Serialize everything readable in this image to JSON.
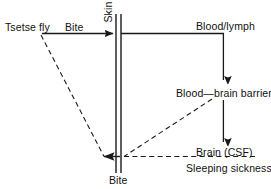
{
  "figure": {
    "type": "flow-diagram",
    "title": "",
    "background_color": "#ffffff",
    "line_color": "#1a1a1a",
    "text_color": "#111111"
  },
  "labels": {
    "tsetse_fly": "Tsetse fly",
    "bite_top": "Bite",
    "skin": "Skin",
    "blood_lymph": "Blood/lymph",
    "blood_brain_barrier": "Blood—brain barrier",
    "brain_csf": "Brain (CSF)",
    "sleeping_sickness": "Sleeping sickness",
    "bite_bottom": "Bite"
  },
  "icons": {
    "arrow_right": "arrow-right-icon",
    "arrow_down": "arrow-down-icon",
    "arrow_left": "arrow-left-icon",
    "skin_barrier": "skin-barrier-icon"
  },
  "edges": [
    {
      "name": "fly-bite-to-skin",
      "style": "solid",
      "direction": "right",
      "from": "Tsetse fly",
      "to": "Skin"
    },
    {
      "name": "skin-to-blood-lymph",
      "style": "solid",
      "direction": "right",
      "from": "Skin",
      "to": "Blood/lymph"
    },
    {
      "name": "blood-lymph-to-bbb",
      "style": "solid",
      "direction": "down",
      "from": "Blood/lymph",
      "to": "Blood—brain barrier"
    },
    {
      "name": "bbb-to-brain",
      "style": "solid",
      "direction": "down",
      "from": "Blood—brain barrier",
      "to": "Brain (CSF)"
    },
    {
      "name": "fly-to-bite-return",
      "style": "dashed",
      "direction": "left",
      "from": "Tsetse fly",
      "to": "Bite"
    },
    {
      "name": "bbb-to-bite-return",
      "style": "dashed",
      "direction": "left",
      "from": "Blood—brain barrier",
      "to": "Bite"
    },
    {
      "name": "sleeping-sickness-to-bite-return",
      "style": "dashed",
      "direction": "left",
      "from": "Sleeping sickness",
      "to": "Bite"
    }
  ]
}
